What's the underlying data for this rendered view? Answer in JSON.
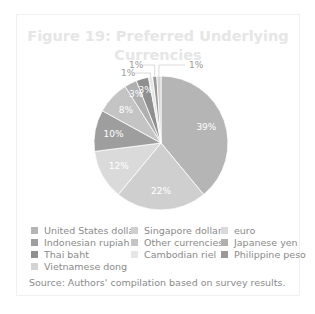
{
  "figure": {
    "title": "Figure 19: Preferred Underlying Currencies",
    "title_line1": "Figure 19: Preferred Underlying",
    "title_line2": "Currencies",
    "source": "Source: Authors' compilation based on survey results."
  },
  "legend": [
    {
      "label": "United States dollar",
      "color": "#b5b5b5"
    },
    {
      "label": "Singapore dollar",
      "color": "#cfcfcf"
    },
    {
      "label": "euro",
      "color": "#dadada"
    },
    {
      "label": "Indonesian rupiah",
      "color": "#9e9e9e"
    },
    {
      "label": "Other currencies",
      "color": "#c4c4c4"
    },
    {
      "label": "Japanese yen",
      "color": "#b0b0b0"
    },
    {
      "label": "Thai baht",
      "color": "#8f8f8f"
    },
    {
      "label": "Cambodian riel",
      "color": "#e6e6e6"
    },
    {
      "label": "Philippine peso",
      "color": "#999999"
    },
    {
      "label": "Vietnamese dong",
      "color": "#d4d4d4"
    }
  ],
  "chart_data": {
    "type": "pie",
    "title": "Figure 19: Preferred Underlying Currencies",
    "categories": [
      "United States dollar",
      "Singapore dollar",
      "euro",
      "Indonesian rupiah",
      "Other currencies",
      "Japanese yen",
      "Thai baht",
      "Cambodian riel",
      "Philippine peso",
      "Vietnamese dong"
    ],
    "values": [
      39,
      22,
      12,
      10,
      8,
      3,
      3,
      1,
      1,
      1
    ],
    "labels": [
      "39%",
      "22%",
      "12%",
      "10%",
      "8%",
      "3%",
      "3%",
      "1%",
      "1%",
      "1%"
    ],
    "unit": "%",
    "legend_position": "bottom",
    "source": "Source: Authors' compilation based on survey results."
  }
}
